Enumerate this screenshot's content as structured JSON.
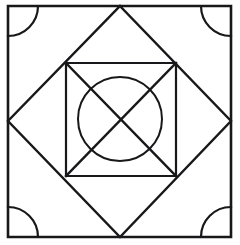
{
  "figure": {
    "canvas": {
      "width": 240,
      "height": 245
    },
    "colors": {
      "stroke": "#18181a",
      "background": "#ffffff"
    },
    "stroke_widths": {
      "outer": 2.6,
      "diamond": 2.4,
      "inner_square": 2.2,
      "diagonal": 2.4,
      "circle": 2.0,
      "arc": 2.2
    },
    "outer_square": {
      "name": "outer-square",
      "left": 8,
      "top": 6,
      "right": 231,
      "bottom": 237,
      "points": "8,6 231,6 231,237 8,237 8,6"
    },
    "diamond": {
      "name": "inscribed-diamond",
      "top": [
        120,
        6
      ],
      "right": [
        231,
        121
      ],
      "bottom": [
        120,
        237
      ],
      "left": [
        8,
        121
      ],
      "points": "120,6 231,121 120,237 8,121 120,6"
    },
    "inner_square": {
      "name": "inner-square",
      "left": 66,
      "top": 63,
      "right": 176,
      "bottom": 176,
      "points": "66,63 176,63 176,176 66,176 66,63"
    },
    "inner_diagonals": {
      "name": "inner-square-diagonals",
      "lines": [
        {
          "x1": 66,
          "y1": 63,
          "x2": 176,
          "y2": 176
        },
        {
          "x1": 176,
          "y1": 63,
          "x2": 66,
          "y2": 176
        }
      ]
    },
    "center_circle": {
      "name": "center-circle",
      "cx": 120,
      "cy": 119,
      "r": 42
    },
    "corner_arcs": [
      {
        "name": "corner-arc-top-left",
        "path": "M 8 36 A 30 30 0 0 0 38 6"
      },
      {
        "name": "corner-arc-top-right",
        "path": "M 201 6 A 30 30 0 0 0 231 36"
      },
      {
        "name": "corner-arc-bottom-right",
        "path": "M 231 207 A 30 30 0 0 0 201 237"
      },
      {
        "name": "corner-arc-bottom-left",
        "path": "M 38 237 A 30 30 0 0 0 8 207"
      }
    ]
  }
}
